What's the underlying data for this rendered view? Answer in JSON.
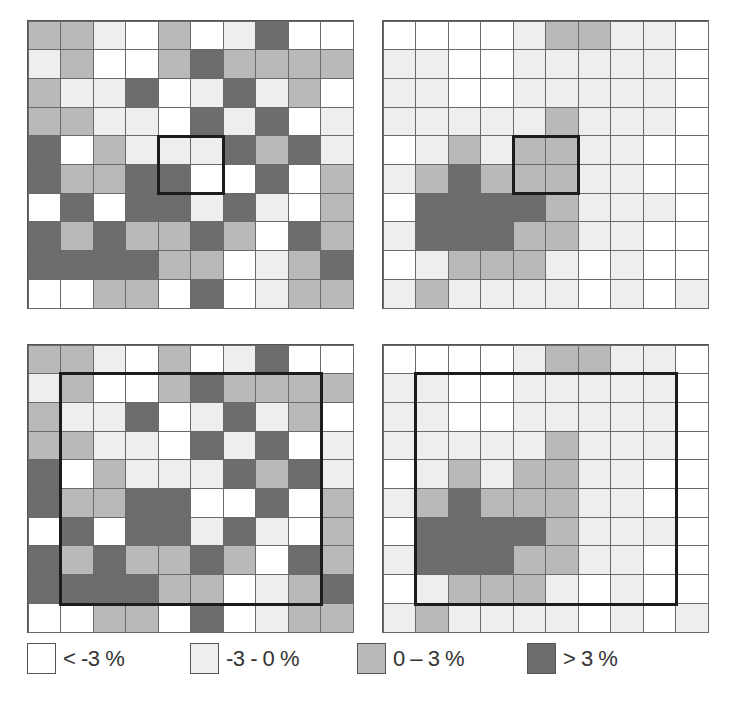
{
  "chart_data": {
    "type": "heatmap",
    "class_codes": {
      "W": "< -3 %",
      "L": "-3 - 0 %",
      "M": "0 – 3 %",
      "D": "> 3 %"
    },
    "panels": [
      {
        "id": "top-left",
        "highlight": {
          "row": 4,
          "col": 4,
          "rows": 2,
          "cols": 2
        },
        "cells": [
          [
            "M",
            "M",
            "L",
            "W",
            "M",
            "W",
            "L",
            "D",
            "W",
            "W"
          ],
          [
            "L",
            "M",
            "W",
            "W",
            "M",
            "D",
            "M",
            "M",
            "M",
            "M"
          ],
          [
            "M",
            "L",
            "L",
            "D",
            "W",
            "L",
            "D",
            "L",
            "M",
            "W"
          ],
          [
            "M",
            "M",
            "L",
            "L",
            "W",
            "D",
            "L",
            "D",
            "W",
            "L"
          ],
          [
            "D",
            "W",
            "M",
            "L",
            "L",
            "L",
            "D",
            "M",
            "D",
            "L"
          ],
          [
            "D",
            "M",
            "M",
            "D",
            "D",
            "W",
            "W",
            "D",
            "W",
            "M"
          ],
          [
            "W",
            "D",
            "W",
            "D",
            "D",
            "L",
            "D",
            "L",
            "W",
            "M"
          ],
          [
            "D",
            "M",
            "D",
            "M",
            "M",
            "D",
            "M",
            "W",
            "D",
            "M"
          ],
          [
            "D",
            "D",
            "D",
            "D",
            "M",
            "M",
            "W",
            "L",
            "M",
            "D"
          ],
          [
            "W",
            "W",
            "M",
            "M",
            "W",
            "D",
            "W",
            "L",
            "M",
            "M"
          ]
        ]
      },
      {
        "id": "top-right",
        "highlight": {
          "row": 4,
          "col": 4,
          "rows": 2,
          "cols": 2
        },
        "cells": [
          [
            "W",
            "W",
            "W",
            "W",
            "L",
            "M",
            "M",
            "L",
            "L",
            "W"
          ],
          [
            "L",
            "L",
            "W",
            "W",
            "L",
            "L",
            "L",
            "L",
            "L",
            "W"
          ],
          [
            "L",
            "L",
            "W",
            "W",
            "L",
            "L",
            "L",
            "L",
            "L",
            "W"
          ],
          [
            "L",
            "L",
            "L",
            "L",
            "L",
            "M",
            "L",
            "L",
            "L",
            "W"
          ],
          [
            "W",
            "L",
            "M",
            "L",
            "M",
            "M",
            "L",
            "L",
            "W",
            "W"
          ],
          [
            "L",
            "M",
            "D",
            "M",
            "M",
            "M",
            "L",
            "L",
            "W",
            "W"
          ],
          [
            "W",
            "D",
            "D",
            "D",
            "D",
            "M",
            "L",
            "L",
            "L",
            "W"
          ],
          [
            "L",
            "D",
            "D",
            "D",
            "M",
            "M",
            "L",
            "L",
            "W",
            "W"
          ],
          [
            "W",
            "L",
            "M",
            "M",
            "M",
            "L",
            "W",
            "L",
            "W",
            "W"
          ],
          [
            "L",
            "M",
            "L",
            "L",
            "L",
            "L",
            "W",
            "L",
            "W",
            "L"
          ]
        ]
      },
      {
        "id": "bottom-left",
        "highlight": {
          "row": 1,
          "col": 1,
          "rows": 8,
          "cols": 8
        },
        "cells": [
          [
            "M",
            "M",
            "L",
            "W",
            "M",
            "W",
            "L",
            "D",
            "W",
            "W"
          ],
          [
            "L",
            "M",
            "W",
            "W",
            "M",
            "D",
            "M",
            "M",
            "M",
            "M"
          ],
          [
            "M",
            "L",
            "L",
            "D",
            "W",
            "L",
            "D",
            "L",
            "M",
            "W"
          ],
          [
            "M",
            "M",
            "L",
            "L",
            "W",
            "D",
            "L",
            "D",
            "W",
            "L"
          ],
          [
            "D",
            "W",
            "M",
            "L",
            "L",
            "L",
            "D",
            "M",
            "D",
            "L"
          ],
          [
            "D",
            "M",
            "M",
            "D",
            "D",
            "W",
            "W",
            "D",
            "W",
            "M"
          ],
          [
            "W",
            "D",
            "W",
            "D",
            "D",
            "L",
            "D",
            "L",
            "W",
            "M"
          ],
          [
            "D",
            "M",
            "D",
            "M",
            "M",
            "D",
            "M",
            "W",
            "D",
            "M"
          ],
          [
            "D",
            "D",
            "D",
            "D",
            "M",
            "M",
            "W",
            "L",
            "M",
            "D"
          ],
          [
            "W",
            "W",
            "M",
            "M",
            "W",
            "D",
            "W",
            "L",
            "M",
            "M"
          ]
        ]
      },
      {
        "id": "bottom-right",
        "highlight": {
          "row": 1,
          "col": 1,
          "rows": 8,
          "cols": 8
        },
        "cells": [
          [
            "W",
            "W",
            "W",
            "W",
            "L",
            "M",
            "M",
            "L",
            "L",
            "W"
          ],
          [
            "L",
            "L",
            "W",
            "W",
            "L",
            "L",
            "L",
            "L",
            "L",
            "W"
          ],
          [
            "L",
            "L",
            "W",
            "W",
            "L",
            "L",
            "L",
            "L",
            "L",
            "W"
          ],
          [
            "L",
            "L",
            "L",
            "L",
            "L",
            "M",
            "L",
            "L",
            "L",
            "W"
          ],
          [
            "W",
            "L",
            "M",
            "L",
            "M",
            "M",
            "L",
            "L",
            "W",
            "W"
          ],
          [
            "L",
            "M",
            "D",
            "M",
            "M",
            "M",
            "L",
            "L",
            "W",
            "W"
          ],
          [
            "W",
            "D",
            "D",
            "D",
            "D",
            "M",
            "L",
            "L",
            "L",
            "W"
          ],
          [
            "L",
            "D",
            "D",
            "D",
            "M",
            "M",
            "L",
            "L",
            "W",
            "W"
          ],
          [
            "W",
            "L",
            "M",
            "M",
            "M",
            "L",
            "W",
            "L",
            "W",
            "W"
          ],
          [
            "L",
            "M",
            "L",
            "L",
            "L",
            "L",
            "W",
            "L",
            "W",
            "L"
          ]
        ]
      }
    ],
    "legend": [
      {
        "code": "W",
        "label": "< -3 %",
        "color": "#ffffff"
      },
      {
        "code": "L",
        "label": "-3 - 0 %",
        "color": "#eeeeee"
      },
      {
        "code": "M",
        "label": "0 – 3 %",
        "color": "#b9b9b9"
      },
      {
        "code": "D",
        "label": "> 3 %",
        "color": "#6d6d6d"
      }
    ]
  },
  "legend": {
    "items": [
      {
        "label": "< -3 %",
        "color": "#ffffff"
      },
      {
        "label": "-3 - 0 %",
        "color": "#eeeeee"
      },
      {
        "label": "0 – 3 %",
        "color": "#b9b9b9"
      },
      {
        "label": "> 3 %",
        "color": "#6d6d6d"
      }
    ]
  }
}
